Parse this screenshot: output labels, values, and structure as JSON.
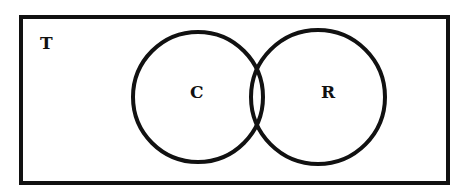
{
  "diagram": {
    "type": "venn",
    "universe": {
      "label": "T",
      "rect": {
        "x": 21,
        "y": 17,
        "width": 427,
        "height": 166
      }
    },
    "sets": [
      {
        "id": "C",
        "label": "C",
        "cx": 198,
        "cy": 97,
        "r": 65
      },
      {
        "id": "R",
        "label": "R",
        "cx": 318,
        "cy": 97,
        "r": 67
      }
    ],
    "stroke_color": "#111111",
    "fill_color": "#ffffff"
  }
}
